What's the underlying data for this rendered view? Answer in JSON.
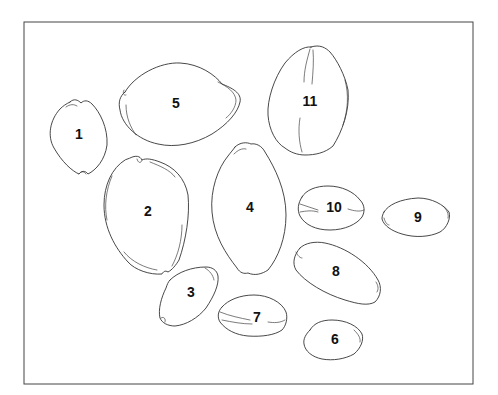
{
  "figure": {
    "type": "line-drawing plate",
    "frame": {
      "x": 24,
      "y": 22,
      "width": 449,
      "height": 362
    },
    "stroke_color": "#333333",
    "background": "#ffffff"
  },
  "specimens": [
    {
      "id": "1",
      "label": "1",
      "cx": 79,
      "cy": 135
    },
    {
      "id": "2",
      "label": "2",
      "cx": 148,
      "cy": 212
    },
    {
      "id": "3",
      "label": "3",
      "cx": 191,
      "cy": 293
    },
    {
      "id": "4",
      "label": "4",
      "cx": 250,
      "cy": 208
    },
    {
      "id": "5",
      "label": "5",
      "cx": 176,
      "cy": 104
    },
    {
      "id": "6",
      "label": "6",
      "cx": 335,
      "cy": 340
    },
    {
      "id": "7",
      "label": "7",
      "cx": 257,
      "cy": 318
    },
    {
      "id": "8",
      "label": "8",
      "cx": 336,
      "cy": 272
    },
    {
      "id": "9",
      "label": "9",
      "cx": 418,
      "cy": 218
    },
    {
      "id": "10",
      "label": "10",
      "cx": 334,
      "cy": 208
    },
    {
      "id": "11",
      "label": "11",
      "cx": 310,
      "cy": 102
    }
  ]
}
